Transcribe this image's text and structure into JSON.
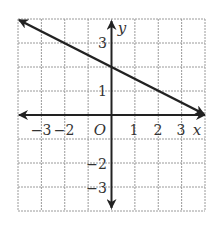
{
  "chart_data": {
    "type": "line",
    "title": "",
    "xlabel": "x",
    "ylabel": "y",
    "origin_label": "O",
    "xlim": [
      -4,
      4
    ],
    "ylim": [
      -4,
      4
    ],
    "grid": true,
    "x_tick_labels": [
      "−3",
      "−2",
      "1",
      "2",
      "3"
    ],
    "x_tick_values": [
      -3,
      -2,
      1,
      2,
      3
    ],
    "y_tick_labels": [
      "3",
      "1",
      "−2",
      "−3"
    ],
    "y_tick_values": [
      3,
      1,
      -2,
      -3
    ],
    "series": [
      {
        "name": "line",
        "equation": "y = -1/2 x + 2",
        "slope": -0.5,
        "y_intercept": 2,
        "points": [
          [
            -4,
            4
          ],
          [
            0,
            2
          ],
          [
            4,
            0
          ]
        ],
        "arrows": "both"
      }
    ]
  },
  "colors": {
    "grid": "#9a9a9a",
    "axes": "#222222",
    "line": "#222222",
    "text": "#333333"
  }
}
